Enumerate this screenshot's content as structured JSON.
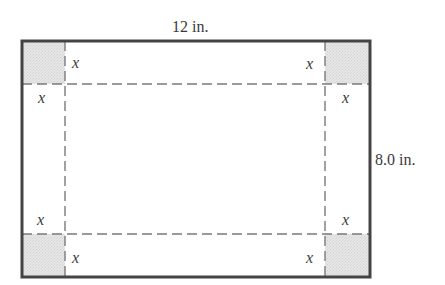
{
  "figure": {
    "type": "sheet-with-cut-corners",
    "width_label": "12 in.",
    "height_label": "8.0 in.",
    "corner_variable": "x",
    "corner_labels": {
      "top_left_right": "x",
      "top_left_below": "x",
      "top_right_left": "x",
      "top_right_below": "x",
      "bottom_left_above": "x",
      "bottom_left_right": "x",
      "bottom_right_above": "x",
      "bottom_right_left": "x"
    },
    "colors": {
      "border": "#444444",
      "dash": "#7a7a7a",
      "corner_fill": "#e4e4e4",
      "text": "#3a3a3a"
    }
  }
}
